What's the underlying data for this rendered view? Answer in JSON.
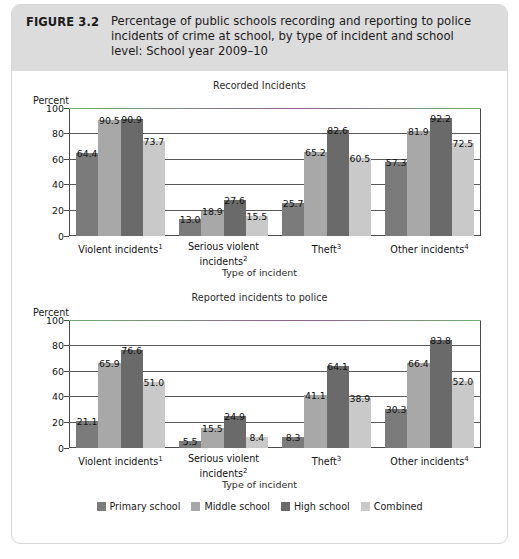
{
  "figure": {
    "label": "FIGURE 3.2",
    "title": "Percentage of public schools recording and reporting to police incidents of crime at school, by type of incident and school level: School year 2009–10"
  },
  "legend": {
    "items": [
      {
        "label": "Primary school",
        "color": "#7b7b7b"
      },
      {
        "label": "Middle school",
        "color": "#a8a8a8"
      },
      {
        "label": "High school",
        "color": "#6a6a6a"
      },
      {
        "label": "Combined",
        "color": "#c9c9c9"
      }
    ]
  },
  "axis": {
    "ylabel": "Percent",
    "xlabel": "Type of incident",
    "yticks": [
      "100",
      "80",
      "60",
      "40",
      "20",
      "0"
    ]
  },
  "categories": [
    {
      "name": "Violent incidents",
      "note": "1"
    },
    {
      "name": "Serious violent incidents",
      "note": "2"
    },
    {
      "name": "Theft",
      "note": "3"
    },
    {
      "name": "Other incidents",
      "note": "4"
    }
  ],
  "chart_data": [
    {
      "type": "bar",
      "title": "Recorded Incidents",
      "xlabel": "Type of incident",
      "ylabel": "Percent",
      "ylim": [
        0,
        100
      ],
      "ytick_step": 20,
      "grid": true,
      "legend_position": "bottom",
      "categories": [
        "Violent incidents",
        "Serious violent incidents",
        "Theft",
        "Other incidents"
      ],
      "series": [
        {
          "name": "Primary school",
          "values": [
            64.4,
            13.0,
            25.7,
            57.3
          ]
        },
        {
          "name": "Middle school",
          "values": [
            90.5,
            18.9,
            65.2,
            81.9
          ]
        },
        {
          "name": "High school",
          "values": [
            90.9,
            27.6,
            82.6,
            92.2
          ]
        },
        {
          "name": "Combined",
          "values": [
            73.7,
            15.5,
            60.5,
            72.5
          ]
        }
      ]
    },
    {
      "type": "bar",
      "title": "Reported incidents to police",
      "xlabel": "Type of incident",
      "ylabel": "Percent",
      "ylim": [
        0,
        100
      ],
      "ytick_step": 20,
      "grid": true,
      "legend_position": "bottom",
      "categories": [
        "Violent incidents",
        "Serious violent incidents",
        "Theft",
        "Other incidents"
      ],
      "series": [
        {
          "name": "Primary school",
          "values": [
            21.1,
            5.5,
            8.3,
            30.3
          ]
        },
        {
          "name": "Middle school",
          "values": [
            65.9,
            15.5,
            41.1,
            66.4
          ]
        },
        {
          "name": "High school",
          "values": [
            76.6,
            24.9,
            64.1,
            83.8
          ]
        },
        {
          "name": "Combined",
          "values": [
            51.0,
            8.4,
            38.9,
            52.0
          ]
        }
      ]
    }
  ]
}
